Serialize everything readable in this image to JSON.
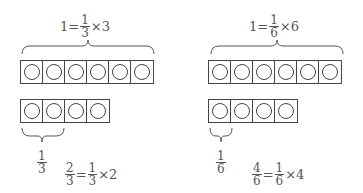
{
  "panels": [
    {
      "top_equation": {
        "lhs": "1=",
        "num": "1",
        "den": "3",
        "rhs": "×3"
      },
      "full_row_cells": 6,
      "partial_row_cells": 4,
      "unit_label": {
        "num": "1",
        "den": "3"
      },
      "bottom_equation": {
        "lhs_num": "2",
        "lhs_den": "3",
        "eq": "=",
        "num": "1",
        "den": "3",
        "rhs": "×2"
      }
    },
    {
      "top_equation": {
        "lhs": "1=",
        "num": "1",
        "den": "6",
        "rhs": "×6"
      },
      "full_row_cells": 6,
      "partial_row_cells": 4,
      "unit_label": {
        "num": "1",
        "den": "6"
      },
      "bottom_equation": {
        "lhs_num": "4",
        "lhs_den": "6",
        "eq": "=",
        "num": "1",
        "den": "6",
        "rhs": "×4"
      }
    }
  ]
}
